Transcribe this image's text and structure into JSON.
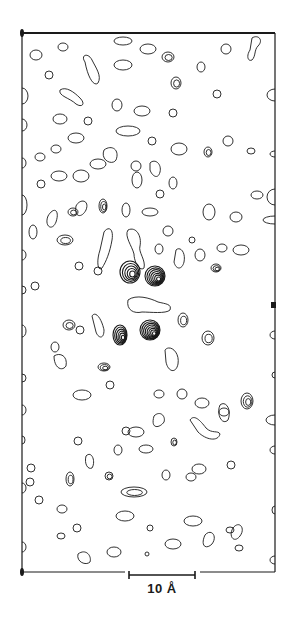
{
  "figure": {
    "type": "electron-density-contour-map",
    "frame": {
      "left": 22,
      "top": 33,
      "right": 275,
      "bottom": 572
    },
    "ink_color": "#1a1a1a",
    "background": "#ffffff"
  },
  "scale_bar": {
    "label": "10 Å",
    "x1": 129,
    "x2": 195,
    "y": 575
  },
  "markers": {
    "corner_top_left": {
      "x": 22,
      "y": 33
    },
    "corner_bottom_left": {
      "x": 22,
      "y": 572
    },
    "right_edge_tick": {
      "x": 273,
      "y": 305
    }
  },
  "contours": {
    "singles": [
      [
        36,
        55,
        6,
        5
      ],
      [
        63,
        47,
        5,
        4
      ],
      [
        49,
        75,
        4,
        4
      ],
      [
        123,
        41,
        9,
        4
      ],
      [
        148,
        49,
        8,
        5
      ],
      [
        123,
        65,
        9,
        5
      ],
      [
        201,
        67,
        4,
        5
      ],
      [
        226,
        49,
        5,
        5
      ],
      [
        217,
        94,
        4,
        4
      ],
      [
        173,
        113,
        4,
        4
      ],
      [
        117,
        105,
        5,
        6
      ],
      [
        142,
        111,
        8,
        5
      ],
      [
        60,
        119,
        7,
        5
      ],
      [
        88,
        121,
        4,
        4
      ],
      [
        128,
        131,
        12,
        5
      ],
      [
        76,
        138,
        8,
        5
      ],
      [
        152,
        141,
        4,
        4
      ],
      [
        56,
        149,
        5,
        4
      ],
      [
        179,
        149,
        8,
        6
      ],
      [
        228,
        141,
        5,
        5
      ],
      [
        251,
        151,
        4,
        3
      ],
      [
        40,
        157,
        5,
        4
      ],
      [
        98,
        164,
        8,
        5
      ],
      [
        136,
        166,
        5,
        5
      ],
      [
        81,
        176,
        8,
        6
      ],
      [
        59,
        176,
        8,
        5
      ],
      [
        41,
        184,
        4,
        4
      ],
      [
        173,
        183,
        4,
        6
      ],
      [
        137,
        180,
        5,
        8
      ],
      [
        160,
        194,
        4,
        4
      ],
      [
        150,
        212,
        8,
        4
      ],
      [
        126,
        210,
        4,
        7
      ],
      [
        209,
        212,
        6,
        8
      ],
      [
        236,
        217,
        6,
        5
      ],
      [
        257,
        195,
        6,
        4
      ],
      [
        168,
        231,
        5,
        5
      ],
      [
        222,
        248,
        5,
        4
      ],
      [
        192,
        240,
        3,
        3
      ],
      [
        159,
        249,
        4,
        5
      ],
      [
        33,
        232,
        4,
        7
      ],
      [
        79,
        266,
        4,
        4
      ],
      [
        241,
        250,
        8,
        5
      ],
      [
        80,
        330,
        4,
        4
      ],
      [
        55,
        347,
        4,
        5
      ],
      [
        110,
        385,
        4,
        4
      ],
      [
        82,
        395,
        9,
        5
      ],
      [
        159,
        394,
        5,
        4
      ],
      [
        182,
        394,
        5,
        5
      ],
      [
        202,
        403,
        7,
        5
      ],
      [
        224,
        412,
        5,
        4
      ],
      [
        126,
        431,
        4,
        4
      ],
      [
        136,
        432,
        8,
        5
      ],
      [
        78,
        441,
        4,
        4
      ],
      [
        118,
        450,
        4,
        5
      ],
      [
        146,
        449,
        7,
        4
      ],
      [
        199,
        469,
        7,
        5
      ],
      [
        166,
        475,
        4,
        5
      ],
      [
        191,
        477,
        5,
        4
      ],
      [
        31,
        468,
        4,
        4
      ],
      [
        30,
        482,
        4,
        4
      ],
      [
        39,
        500,
        4,
        4
      ],
      [
        62,
        509,
        5,
        4
      ],
      [
        125,
        516,
        9,
        5
      ],
      [
        193,
        521,
        9,
        5
      ],
      [
        150,
        528,
        3,
        3
      ],
      [
        77,
        528,
        4,
        4
      ],
      [
        61,
        536,
        4,
        3
      ],
      [
        230,
        530,
        4,
        3
      ],
      [
        173,
        544,
        8,
        5
      ],
      [
        239,
        548,
        4,
        3
      ],
      [
        147,
        554,
        2,
        2
      ],
      [
        114,
        552,
        7,
        5
      ],
      [
        231,
        465,
        4,
        4
      ],
      [
        200,
        255,
        5,
        6
      ],
      [
        98,
        271,
        4,
        4
      ],
      [
        35,
        286,
        4,
        4
      ]
    ],
    "multi": [
      {
        "cx": 168,
        "cy": 57,
        "rx": 6,
        "ry": 5,
        "rings": 2
      },
      {
        "cx": 176,
        "cy": 83,
        "rx": 5,
        "ry": 6,
        "rings": 2
      },
      {
        "cx": 208,
        "cy": 152,
        "rx": 4,
        "ry": 5,
        "rings": 2
      },
      {
        "cx": 103,
        "cy": 206,
        "rx": 4,
        "ry": 7,
        "rings": 3
      },
      {
        "cx": 73,
        "cy": 212,
        "rx": 5,
        "ry": 4,
        "rings": 2
      },
      {
        "cx": 65,
        "cy": 240,
        "rx": 8,
        "ry": 5,
        "rings": 2
      },
      {
        "cx": 130,
        "cy": 272,
        "rx": 10,
        "ry": 11,
        "rings": 5
      },
      {
        "cx": 155,
        "cy": 276,
        "rx": 10,
        "ry": 10,
        "rings": 7
      },
      {
        "cx": 216,
        "cy": 268,
        "rx": 5,
        "ry": 4,
        "rings": 3
      },
      {
        "cx": 120,
        "cy": 335,
        "rx": 7,
        "ry": 10,
        "rings": 6
      },
      {
        "cx": 150,
        "cy": 330,
        "rx": 10,
        "ry": 10,
        "rings": 8
      },
      {
        "cx": 104,
        "cy": 367,
        "rx": 6,
        "ry": 4,
        "rings": 3
      },
      {
        "cx": 208,
        "cy": 338,
        "rx": 6,
        "ry": 7,
        "rings": 2
      },
      {
        "cx": 183,
        "cy": 320,
        "rx": 5,
        "ry": 7,
        "rings": 2
      },
      {
        "cx": 247,
        "cy": 401,
        "rx": 6,
        "ry": 8,
        "rings": 3
      },
      {
        "cx": 70,
        "cy": 479,
        "rx": 4,
        "ry": 7,
        "rings": 2
      },
      {
        "cx": 109,
        "cy": 476,
        "rx": 4,
        "ry": 4,
        "rings": 2
      },
      {
        "cx": 134,
        "cy": 492,
        "rx": 13,
        "ry": 5,
        "rings": 2
      },
      {
        "cx": 174,
        "cy": 442,
        "rx": 3,
        "ry": 4,
        "rings": 2
      },
      {
        "cx": 69,
        "cy": 325,
        "rx": 6,
        "ry": 5,
        "rings": 2
      }
    ],
    "blobs": [
      "M85 62 C80 55 88 52 92 60 C96 68 102 76 98 83 C94 87 88 78 85 62 Z",
      "M60 90 C66 86 74 92 80 98 C86 104 82 108 76 104 C70 98 58 96 60 90 Z",
      "M252 38 C258 34 264 40 258 46 C254 50 256 56 252 60 C248 62 246 56 250 50 Z",
      "M150 163 C155 158 162 164 160 172 C158 180 152 176 150 170 Z",
      "M76 206 C80 198 90 200 86 210 C82 218 74 218 76 206 Z",
      "M48 216 C54 206 60 210 56 222 C52 232 44 226 48 216 Z",
      "M104 232 C108 226 114 228 112 240 C110 252 106 262 102 268 C98 272 96 262 100 250 Z",
      "M128 230 C136 226 142 236 140 246 C138 252 146 260 144 268 C140 272 134 262 134 254 C132 246 124 236 128 230 Z",
      "M176 250 C180 246 186 252 184 262 C182 270 176 270 174 262 Z",
      "M128 300 C136 294 150 298 158 302 C166 304 172 304 170 310 C166 314 150 312 142 312 C134 314 126 310 128 300 Z",
      "M92 316 C96 310 102 320 104 330 C104 340 98 338 96 332 Z",
      "M165 350 C170 344 180 352 178 364 C176 374 168 372 166 362 Z",
      "M54 356 C60 352 68 356 66 366 C62 372 54 368 54 356 Z",
      "M190 420 C194 414 200 420 206 428 C212 434 218 430 220 434 C218 442 206 440 198 432 Z",
      "M154 416 C160 410 166 416 164 422 C160 428 150 430 154 416 Z",
      "M220 405 C226 400 232 410 228 420 C222 426 216 414 220 405 Z",
      "M86 456 C92 450 96 462 92 468 C88 470 84 464 86 456 Z",
      "M233 528 C239 520 246 528 240 536 C234 544 228 536 233 528 Z",
      "M78 554 C86 548 92 556 90 562 C86 566 76 562 78 554 Z",
      "M205 535 C211 528 218 536 212 544 C206 550 200 546 205 535 Z",
      "M104 150 C112 144 120 150 116 160 C112 166 100 160 104 150 Z"
    ],
    "edge_arcs": [
      [
        22,
        96,
        6,
        8
      ],
      [
        22,
        125,
        5,
        6
      ],
      [
        22,
        163,
        4,
        5
      ],
      [
        22,
        205,
        5,
        10
      ],
      [
        22,
        255,
        4,
        5
      ],
      [
        22,
        290,
        4,
        4
      ],
      [
        22,
        331,
        4,
        6
      ],
      [
        22,
        378,
        4,
        4
      ],
      [
        22,
        410,
        4,
        5
      ],
      [
        22,
        440,
        3,
        4
      ],
      [
        22,
        488,
        4,
        5
      ],
      [
        22,
        547,
        4,
        5
      ],
      [
        275,
        95,
        8,
        6
      ],
      [
        275,
        154,
        5,
        3
      ],
      [
        275,
        197,
        8,
        8
      ],
      [
        275,
        220,
        12,
        4
      ],
      [
        275,
        335,
        5,
        4
      ],
      [
        275,
        375,
        3,
        3
      ],
      [
        275,
        420,
        9,
        5
      ],
      [
        275,
        450,
        5,
        4
      ],
      [
        275,
        510,
        3,
        4
      ],
      [
        275,
        560,
        5,
        4
      ]
    ]
  }
}
